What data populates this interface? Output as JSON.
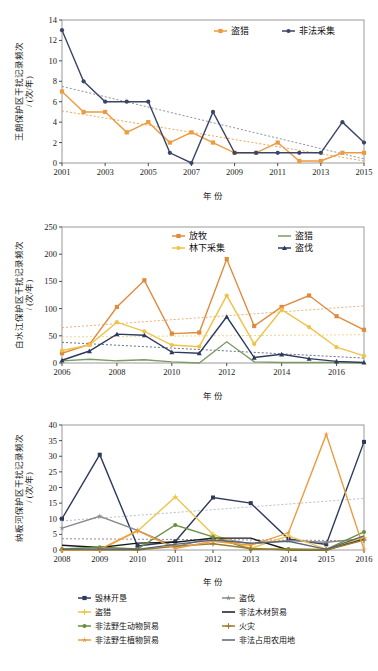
{
  "figure": {
    "axis_unit_label": "/ (次/年)",
    "xlabel": "年   份"
  },
  "charts": [
    {
      "id": "wanglang",
      "ylabel_main": "王朗保护区干扰记录频次",
      "ylabel_unit": "/ (次/年)",
      "xlabel": "年   份",
      "ylim": [
        0,
        14
      ],
      "yticks": [
        "0",
        "2",
        "4",
        "6",
        "8",
        "10",
        "12",
        "14"
      ],
      "xticks": [
        "2001",
        "2003",
        "2005",
        "2007",
        "2009",
        "2011",
        "2013",
        "2015"
      ],
      "legend": [
        {
          "label": "盗猎",
          "color": "#ED9B3F",
          "marker": "square"
        },
        {
          "label": "非法采集",
          "color": "#3B4568",
          "marker": "circle"
        }
      ]
    },
    {
      "id": "baishuijiang",
      "ylabel_main": "白水江保护区干扰记录频次",
      "ylabel_unit": "/ (次/年)",
      "xlabel": "年   份",
      "ylim": [
        0,
        250
      ],
      "yticks": [
        "0",
        "50",
        "100",
        "150",
        "200",
        "250"
      ],
      "xticks": [
        "2006",
        "2008",
        "2010",
        "2012",
        "2014",
        "2016"
      ],
      "legend": [
        {
          "label": "放牧",
          "color": "#E08A3C",
          "marker": "square"
        },
        {
          "label": "林下采集",
          "color": "#EFC34A",
          "marker": "circle"
        },
        {
          "label": "盗猎",
          "color": "#7C9A62",
          "marker": "line"
        },
        {
          "label": "盗伐",
          "color": "#2E3A5C",
          "marker": "triangle"
        }
      ]
    },
    {
      "id": "nabanhe",
      "ylabel_main": "纳板河保护区干扰记录频次",
      "ylabel_unit": "/ (次/年)",
      "xlabel": "年   份",
      "ylim": [
        0,
        40
      ],
      "yticks": [
        "0",
        "5",
        "10",
        "15",
        "20",
        "25",
        "30",
        "35",
        "40"
      ],
      "xticks": [
        "2008",
        "2009",
        "2010",
        "2011",
        "2012",
        "2013",
        "2014",
        "2015",
        "2016"
      ],
      "legend": [
        {
          "label": "毁林开垦",
          "color": "#2E3A5C",
          "marker": "square"
        },
        {
          "label": "盗伐",
          "color": "#8A8A8A",
          "marker": "star"
        },
        {
          "label": "盗猎",
          "color": "#EFC34A",
          "marker": "plus"
        },
        {
          "label": "非法木材贸易",
          "color": "#1A1A1A",
          "marker": "line"
        },
        {
          "label": "非法野生动物贸易",
          "color": "#6B8E3E",
          "marker": "circle"
        },
        {
          "label": "火灾",
          "color": "#9A7B2E",
          "marker": "plus"
        },
        {
          "label": "非法野生植物贸易",
          "color": "#ED9B3F",
          "marker": "star"
        },
        {
          "label": "非法占用农用地",
          "color": "#5A6478",
          "marker": "line"
        }
      ]
    }
  ],
  "chart_data": [
    {
      "type": "line",
      "title": "王朗保护区干扰记录频次",
      "xlabel": "年   份",
      "ylabel": "王朗保护区干扰记录频次 / (次/年)",
      "ylim": [
        0,
        14
      ],
      "xlim": [
        2001,
        2015
      ],
      "grid": false,
      "legend_position": "top-right",
      "x": [
        2001,
        2002,
        2003,
        2004,
        2005,
        2006,
        2007,
        2008,
        2009,
        2010,
        2011,
        2012,
        2013,
        2014,
        2015
      ],
      "series": [
        {
          "name": "盗猎",
          "color": "#ED9B3F",
          "values": [
            7,
            5,
            5,
            3,
            4,
            2,
            3,
            2,
            1,
            1,
            2,
            0.2,
            0.2,
            1,
            1
          ]
        },
        {
          "name": "非法采集",
          "color": "#3B4568",
          "values": [
            13,
            8,
            6,
            6,
            6,
            1,
            0,
            5,
            1,
            1,
            1,
            1,
            1,
            4,
            2
          ]
        }
      ],
      "trendlines": [
        {
          "name": "盗猎趋势",
          "color": "#ED9B3F",
          "style": "dotted",
          "from": [
            2001,
            5.1
          ],
          "to": [
            2015,
            0.2
          ]
        },
        {
          "name": "非法采集趋势",
          "color": "#7E8496",
          "style": "dotted",
          "from": [
            2001,
            7.5
          ],
          "to": [
            2015,
            0.4
          ]
        }
      ]
    },
    {
      "type": "line",
      "title": "白水江保护区干扰记录频次",
      "xlabel": "年   份",
      "ylabel": "白水江保护区干扰记录频次 / (次/年)",
      "ylim": [
        0,
        250
      ],
      "xlim": [
        2006,
        2017
      ],
      "grid": false,
      "legend_position": "top-center",
      "x": [
        2006,
        2007,
        2008,
        2009,
        2010,
        2011,
        2012,
        2013,
        2014,
        2015,
        2016,
        2017
      ],
      "series": [
        {
          "name": "放牧",
          "color": "#E08A3C",
          "values": [
            18,
            34,
            103,
            152,
            54,
            56,
            191,
            68,
            103,
            124,
            86,
            61
          ]
        },
        {
          "name": "林下采集",
          "color": "#EFC34A",
          "values": [
            23,
            33,
            75,
            58,
            33,
            30,
            124,
            35,
            98,
            66,
            29,
            13
          ]
        },
        {
          "name": "盗猎",
          "color": "#7C9A62",
          "values": [
            4,
            7,
            4,
            6,
            2,
            0,
            39,
            2,
            1,
            1,
            1,
            0
          ]
        },
        {
          "name": "盗伐",
          "color": "#2E3A5C",
          "values": [
            5,
            22,
            53,
            51,
            20,
            18,
            85,
            10,
            16,
            8,
            3,
            1
          ]
        }
      ],
      "trendlines": [
        {
          "name": "放牧趋势",
          "color": "#E8A869",
          "style": "dotted",
          "from": [
            2006,
            65
          ],
          "to": [
            2017,
            105
          ]
        },
        {
          "name": "林下采集趋势",
          "color": "#EFD08A",
          "style": "dotted",
          "from": [
            2006,
            48
          ],
          "to": [
            2017,
            52
          ]
        },
        {
          "name": "盗伐趋势",
          "color": "#55607E",
          "style": "dotted",
          "from": [
            2006,
            38
          ],
          "to": [
            2017,
            9
          ]
        }
      ]
    },
    {
      "type": "line",
      "title": "纳板河保护区干扰记录频次",
      "xlabel": "年   份",
      "ylabel": "纳板河保护区干扰记录频次 / (次/年)",
      "ylim": [
        0,
        40
      ],
      "xlim": [
        2008,
        2016
      ],
      "grid": false,
      "legend_position": "bottom",
      "x": [
        2008,
        2009,
        2010,
        2011,
        2012,
        2013,
        2014,
        2015,
        2016
      ],
      "series": [
        {
          "name": "毁林开垦",
          "color": "#2E3A5C",
          "values": [
            10,
            30.5,
            1.3,
            2.7,
            16.8,
            15,
            3.5,
            1.8,
            34.6
          ]
        },
        {
          "name": "盗伐",
          "color": "#8A8A8A",
          "values": [
            7,
            10.8,
            6.3,
            1,
            4,
            2,
            3,
            2.5,
            3.6
          ]
        },
        {
          "name": "盗猎",
          "color": "#EFC34A",
          "values": [
            0,
            0,
            6,
            17,
            5,
            0.5,
            4.5,
            0.3,
            4
          ]
        },
        {
          "name": "非法木材贸易",
          "color": "#1A1A1A",
          "values": [
            1.5,
            0.8,
            2.2,
            2.5,
            3.8,
            3.8,
            0,
            0,
            3.5
          ]
        },
        {
          "name": "非法野生动物贸易",
          "color": "#6B8E3E",
          "values": [
            0.3,
            0.9,
            0.3,
            8,
            4.2,
            0.2,
            0.3,
            0.2,
            5.8
          ]
        },
        {
          "name": "火灾",
          "color": "#9A7B2E",
          "values": [
            0,
            0,
            0,
            1.2,
            2,
            0.5,
            0,
            0,
            3.2
          ]
        },
        {
          "name": "非法野生植物贸易",
          "color": "#ED9B3F",
          "values": [
            0,
            0.2,
            6.2,
            0.5,
            2.8,
            1.5,
            5.5,
            37,
            0.2
          ]
        },
        {
          "name": "非法占用农用地",
          "color": "#5A6478",
          "values": [
            0.2,
            0.3,
            0.2,
            1.8,
            3.2,
            2.2,
            2.8,
            0.2,
            4.5
          ]
        }
      ],
      "trendlines": [
        {
          "name": "趋势1",
          "color": "#AEB6C6",
          "style": "dotted",
          "from": [
            2008,
            9.3
          ],
          "to": [
            2016,
            16.5
          ]
        },
        {
          "name": "趋势2",
          "color": "#8A7B8E",
          "style": "dotted",
          "from": [
            2008,
            3.6
          ],
          "to": [
            2016,
            3.0
          ]
        }
      ]
    }
  ]
}
